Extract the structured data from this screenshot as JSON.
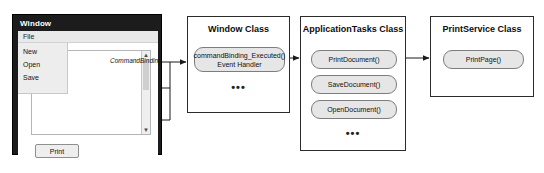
{
  "diagram": {
    "annotation_label": "CommandBinding"
  },
  "window_app": {
    "title": "Window",
    "menubar": {
      "file": "File"
    },
    "menu_items": [
      {
        "label": "New"
      },
      {
        "label": "Open"
      },
      {
        "label": "Save"
      }
    ],
    "scrollbar": {
      "up_arrow": "▲",
      "down_arrow": "▼"
    },
    "print_button": "Print"
  },
  "classes": [
    {
      "id": "window-class",
      "title": "Window Class",
      "methods": [
        {
          "line1": "commandBinding_Executed()",
          "line2": "Event Handler"
        }
      ],
      "ellipsis": "•••"
    },
    {
      "id": "application-tasks-class",
      "title": "ApplicationTasks Class",
      "methods": [
        {
          "line1": "PrintDocument()"
        },
        {
          "line1": "SaveDocument()"
        },
        {
          "line1": "OpenDocument()"
        }
      ],
      "ellipsis": "•••"
    },
    {
      "id": "print-service-class",
      "title": "PrintService Class",
      "methods": [
        {
          "line1": "PrintPage()"
        }
      ]
    }
  ],
  "colors": {
    "frame": "#1c1c1c",
    "pill_fill": "#e6e6e6",
    "pill_stroke": "#7d7d7d",
    "box_stroke": "#2b2b2b",
    "connector": "#1a1a1a"
  }
}
